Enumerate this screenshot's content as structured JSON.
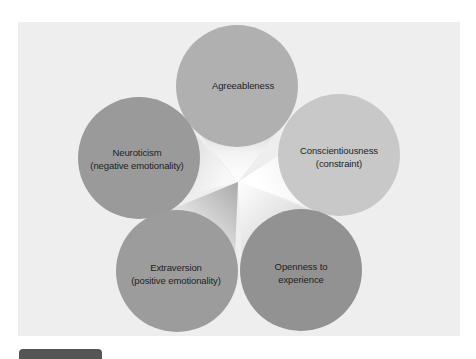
{
  "diagram": {
    "title": "",
    "center": {
      "x": 238,
      "y": 182
    },
    "background_color": "#eeeeee",
    "nodes": [
      {
        "id": "agreeableness",
        "line1": "Agreeableness",
        "line2": "",
        "cx": 237,
        "cy": 86,
        "r": 61,
        "color": "#b0b0b0",
        "label_y": 86
      },
      {
        "id": "neuroticism",
        "line1": "Neuroticism",
        "line2": "(negative emotionality)",
        "cx": 139,
        "cy": 158,
        "r": 61,
        "color": "#9a9a9a",
        "label_y": 159
      },
      {
        "id": "conscientiousness",
        "line1": "Conscientiousness",
        "line2": "(constraint)",
        "cx": 339,
        "cy": 155,
        "r": 61,
        "color": "#c8c8c8",
        "label_y": 157
      },
      {
        "id": "extraversion",
        "line1": "Extraversion",
        "line2": "(positive emotionality)",
        "cx": 177,
        "cy": 271,
        "r": 61,
        "color": "#9c9c9c",
        "label_y": 274
      },
      {
        "id": "openness",
        "line1": "Openness to",
        "line2": "experience",
        "cx": 301,
        "cy": 270,
        "r": 61,
        "color": "#929292",
        "label_y": 273
      }
    ]
  }
}
